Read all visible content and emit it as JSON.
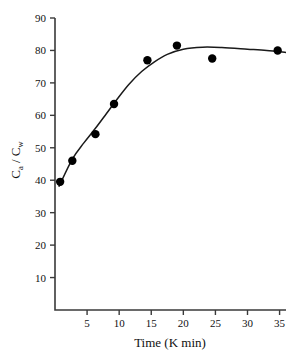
{
  "chart_data": {
    "type": "scatter",
    "title": "",
    "xlabel": "Time (K min)",
    "ylabel": "Ca / Cw",
    "ylabel_parts": {
      "numerator_base": "C",
      "numerator_sub": "a",
      "separator": "/",
      "denominator_base": "C",
      "denominator_sub": "w"
    },
    "xlim": [
      0,
      36
    ],
    "ylim": [
      0,
      90
    ],
    "xticks": [
      5,
      10,
      15,
      20,
      25,
      30,
      35
    ],
    "yticks": [
      10,
      20,
      30,
      40,
      50,
      60,
      70,
      80,
      90
    ],
    "grid": false,
    "legend": null,
    "series": [
      {
        "name": "measured",
        "marker": "filled-circle",
        "color": "#000000",
        "points": [
          {
            "x": 0.8,
            "y": 39.5
          },
          {
            "x": 2.7,
            "y": 46.0
          },
          {
            "x": 6.3,
            "y": 54.2
          },
          {
            "x": 9.2,
            "y": 63.5
          },
          {
            "x": 14.4,
            "y": 77.0
          },
          {
            "x": 19.0,
            "y": 81.5
          },
          {
            "x": 24.5,
            "y": 77.5
          },
          {
            "x": 34.7,
            "y": 80.0
          }
        ]
      },
      {
        "name": "fitted-curve",
        "marker": "none",
        "color": "#1a1a1a",
        "points": [
          {
            "x": 0.6,
            "y": 38.0
          },
          {
            "x": 2.7,
            "y": 46.5
          },
          {
            "x": 4.5,
            "y": 51.5
          },
          {
            "x": 6.3,
            "y": 56.0
          },
          {
            "x": 8.0,
            "y": 60.5
          },
          {
            "x": 9.5,
            "y": 64.5
          },
          {
            "x": 11.5,
            "y": 69.5
          },
          {
            "x": 13.5,
            "y": 73.5
          },
          {
            "x": 15.5,
            "y": 76.5
          },
          {
            "x": 17.5,
            "y": 78.8
          },
          {
            "x": 20.0,
            "y": 80.4
          },
          {
            "x": 23.0,
            "y": 81.0
          },
          {
            "x": 26.0,
            "y": 80.9
          },
          {
            "x": 30.0,
            "y": 80.4
          },
          {
            "x": 33.0,
            "y": 80.0
          },
          {
            "x": 36.0,
            "y": 79.4
          }
        ]
      }
    ]
  },
  "axes": {
    "x_tick_labels": [
      "5",
      "10",
      "15",
      "20",
      "25",
      "30",
      "35"
    ],
    "y_tick_labels": [
      "10",
      "20",
      "30",
      "40",
      "50",
      "60",
      "70",
      "80",
      "90"
    ],
    "x_title": "Time (K min)",
    "y_title": "Ca / Cw"
  },
  "colors": {
    "background": "#ffffff",
    "axis": "#3a3a3a",
    "marker": "#000000",
    "curve": "#1a1a1a",
    "text": "#111111"
  }
}
